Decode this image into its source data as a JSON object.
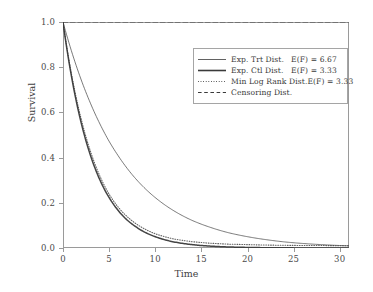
{
  "chart_data": {
    "type": "line",
    "title": "",
    "xlabel": "Time",
    "ylabel": "Survival",
    "xlim": [
      0,
      31
    ],
    "ylim": [
      0.0,
      1.0
    ],
    "grid": false,
    "legend_position": "upper right",
    "xticks": [
      "0",
      "5",
      "10",
      "15",
      "20",
      "25",
      "30"
    ],
    "xtick_values": [
      0,
      5,
      10,
      15,
      20,
      25,
      30
    ],
    "yticks": [
      "0.0",
      "0.2",
      "0.4",
      "0.6",
      "0.8",
      "1.0"
    ],
    "ytick_values": [
      0.0,
      0.2,
      0.4,
      0.6,
      0.8,
      1.0
    ],
    "series": [
      {
        "name": "Exp. Trt Dist.",
        "annotation": "E(F) = 6.67",
        "style": "solid-thin",
        "rate": 0.15,
        "x": [
          0,
          1,
          2,
          3,
          4,
          5,
          6,
          7,
          8,
          9,
          10,
          12,
          14,
          16,
          18,
          20,
          22,
          24,
          26,
          28,
          30,
          31
        ],
        "values": [
          1.0,
          0.861,
          0.741,
          0.638,
          0.549,
          0.472,
          0.407,
          0.35,
          0.301,
          0.259,
          0.223,
          0.165,
          0.122,
          0.091,
          0.067,
          0.05,
          0.037,
          0.027,
          0.02,
          0.015,
          0.011,
          0.0096
        ]
      },
      {
        "name": "Exp. Ctl Dist.",
        "annotation": "E(F) = 3.33",
        "style": "solid-thick",
        "rate": 0.3,
        "x": [
          0,
          1,
          2,
          3,
          4,
          5,
          6,
          7,
          8,
          9,
          10,
          12,
          14,
          16,
          18,
          20,
          22,
          24,
          26,
          28,
          30,
          31
        ],
        "values": [
          1.0,
          0.741,
          0.549,
          0.407,
          0.301,
          0.223,
          0.165,
          0.122,
          0.091,
          0.067,
          0.05,
          0.027,
          0.015,
          0.0082,
          0.0045,
          0.0025,
          0.0014,
          0.00075,
          0.00041,
          0.00022,
          0.00012,
          9e-05
        ]
      },
      {
        "name": "Min Log Rank Dist.",
        "annotation": "E(F) = 3.33",
        "style": "dotted",
        "rate": 0.3,
        "x": [
          0,
          1,
          2,
          3,
          4,
          5,
          6,
          7,
          8,
          9,
          10,
          12,
          14,
          16,
          18,
          20,
          22,
          24,
          26,
          28,
          30,
          31
        ],
        "values": [
          1.0,
          0.752,
          0.566,
          0.425,
          0.318,
          0.238,
          0.18,
          0.137,
          0.105,
          0.081,
          0.063,
          0.04,
          0.028,
          0.021,
          0.017,
          0.015,
          0.013,
          0.012,
          0.011,
          0.011,
          0.01,
          0.01
        ]
      },
      {
        "name": "Censoring Dist.",
        "annotation": "",
        "style": "dashed",
        "x": [
          0,
          31
        ],
        "values": [
          1.0,
          1.0
        ]
      }
    ]
  },
  "legend": {
    "rows": [
      {
        "label": "Exp. Trt Dist.",
        "value": "E(F) = 6.67"
      },
      {
        "label": "Exp. Ctl Dist.",
        "value": "E(F) = 3.33"
      },
      {
        "label": "Min Log Rank Dist.",
        "value": "E(F) = 3.33"
      },
      {
        "label": "Censoring Dist.",
        "value": ""
      }
    ]
  },
  "colors": {
    "line": "#3a3a3a",
    "frame": "#9a9a9a",
    "background": "#ffffff"
  }
}
